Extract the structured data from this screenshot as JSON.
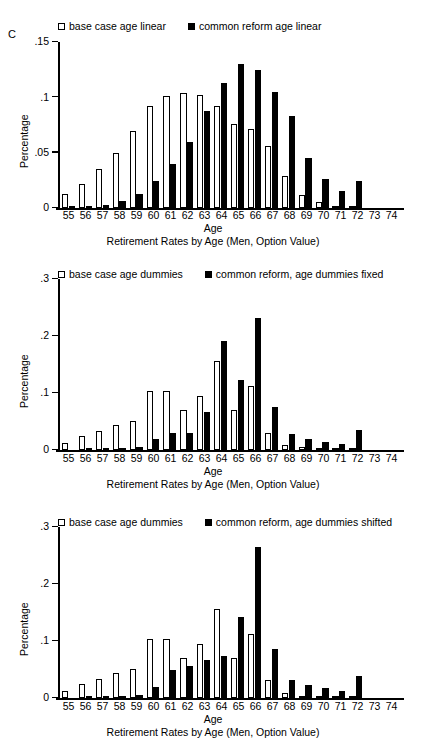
{
  "figure": {
    "panel_letter": "C"
  },
  "chart_data": [
    {
      "type": "bar",
      "panel": "C",
      "title": "",
      "caption": "Retirement Rates by Age (Men, Option Value)",
      "xlabel": "Age",
      "ylabel": "Percentage",
      "ylim": [
        0,
        0.15
      ],
      "yticks": [
        0,
        0.05,
        0.1,
        0.15
      ],
      "ytick_labels": [
        "0",
        ".05",
        ".1",
        ".15"
      ],
      "grid": false,
      "legend_position": "top",
      "categories": [
        "55",
        "56",
        "57",
        "58",
        "59",
        "60",
        "61",
        "62",
        "63",
        "64",
        "65",
        "66",
        "67",
        "68",
        "69",
        "70",
        "71",
        "72",
        "73",
        "74"
      ],
      "series": [
        {
          "name": "base case age linear",
          "style": "open",
          "values": [
            0.013,
            0.022,
            0.035,
            0.05,
            0.07,
            0.092,
            0.101,
            0.104,
            0.102,
            0.092,
            0.076,
            0.071,
            0.056,
            0.029,
            0.012,
            0.005,
            0.002,
            0.002,
            0.0,
            0.0
          ]
        },
        {
          "name": "common reform age linear",
          "style": "solid",
          "values": [
            0.001,
            0.002,
            0.003,
            0.006,
            0.013,
            0.024,
            0.04,
            0.06,
            0.088,
            0.113,
            0.13,
            0.125,
            0.105,
            0.083,
            0.045,
            0.026,
            0.015,
            0.024,
            0.0,
            0.0
          ]
        }
      ]
    },
    {
      "type": "bar",
      "panel": "",
      "title": "",
      "caption": "Retirement Rates by Age (Men, Option Value)",
      "xlabel": "Age",
      "ylabel": "Percentage",
      "ylim": [
        0,
        0.3
      ],
      "yticks": [
        0,
        0.1,
        0.2,
        0.3
      ],
      "ytick_labels": [
        "0",
        ".1",
        ".2",
        ".3"
      ],
      "grid": false,
      "legend_position": "top",
      "categories": [
        "55",
        "56",
        "57",
        "58",
        "59",
        "60",
        "61",
        "62",
        "63",
        "64",
        "65",
        "66",
        "67",
        "68",
        "69",
        "70",
        "71",
        "72",
        "73",
        "74"
      ],
      "series": [
        {
          "name": "base case age dummies",
          "style": "open",
          "values": [
            0.012,
            0.024,
            0.033,
            0.044,
            0.051,
            0.103,
            0.103,
            0.071,
            0.094,
            0.156,
            0.07,
            0.112,
            0.03,
            0.008,
            0.005,
            0.003,
            0.002,
            0.002,
            0.0,
            0.0
          ]
        },
        {
          "name": "common reform, age dummies fixed",
          "style": "solid",
          "values": [
            0.0,
            0.001,
            0.001,
            0.002,
            0.005,
            0.019,
            0.03,
            0.03,
            0.066,
            0.191,
            0.123,
            0.232,
            0.075,
            0.028,
            0.02,
            0.014,
            0.01,
            0.035,
            0.0,
            0.0
          ]
        }
      ]
    },
    {
      "type": "bar",
      "panel": "",
      "title": "",
      "caption": "Retirement Rates by Age (Men, Option Value)",
      "xlabel": "Age",
      "ylabel": "Percentage",
      "ylim": [
        0,
        0.3
      ],
      "yticks": [
        0,
        0.1,
        0.2,
        0.3
      ],
      "ytick_labels": [
        "0",
        ".1",
        ".2",
        ".3"
      ],
      "grid": false,
      "legend_position": "top",
      "categories": [
        "55",
        "56",
        "57",
        "58",
        "59",
        "60",
        "61",
        "62",
        "63",
        "64",
        "65",
        "66",
        "67",
        "68",
        "69",
        "70",
        "71",
        "72",
        "73",
        "74"
      ],
      "series": [
        {
          "name": "base case age dummies",
          "style": "open",
          "values": [
            0.012,
            0.025,
            0.034,
            0.044,
            0.051,
            0.103,
            0.103,
            0.071,
            0.094,
            0.156,
            0.07,
            0.112,
            0.031,
            0.008,
            0.004,
            0.003,
            0.002,
            0.002,
            0.0,
            0.0
          ]
        },
        {
          "name": "common reform, age dummies shifted",
          "style": "solid",
          "values": [
            0.0,
            0.001,
            0.001,
            0.003,
            0.006,
            0.019,
            0.049,
            0.057,
            0.066,
            0.074,
            0.143,
            0.265,
            0.086,
            0.032,
            0.023,
            0.017,
            0.012,
            0.038,
            0.0,
            0.0
          ]
        }
      ]
    }
  ]
}
